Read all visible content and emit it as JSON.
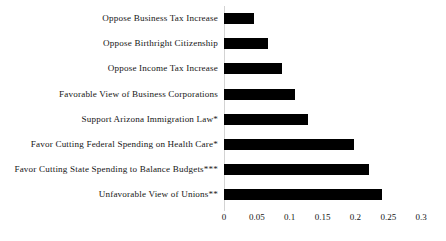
{
  "chart_data": {
    "type": "bar",
    "orientation": "horizontal",
    "title": "",
    "xlabel": "",
    "ylabel": "",
    "xlim": [
      0,
      0.3
    ],
    "xticks": [
      "0",
      "0.05",
      "0.1",
      "0.15",
      "0.2",
      "0.25",
      "0.3"
    ],
    "xtick_values": [
      0,
      0.05,
      0.1,
      0.15,
      0.2,
      0.25,
      0.3
    ],
    "grid": false,
    "legend": false,
    "bar_color": "#000000",
    "axis_color": "#d3d3d3",
    "categories": [
      "Oppose Business Tax Increase",
      "Oppose Birthright Citizenship",
      "Oppose Income Tax Increase",
      "Favorable View of Business Corporations",
      "Support Arizona Immigration Law*",
      "Favor Cutting Federal Spending on Health Care*",
      "Favor Cutting State Spending to Balance Budgets***",
      "Unfavorable View of Unions**"
    ],
    "values": [
      0.045,
      0.067,
      0.088,
      0.108,
      0.128,
      0.198,
      0.22,
      0.24
    ]
  }
}
